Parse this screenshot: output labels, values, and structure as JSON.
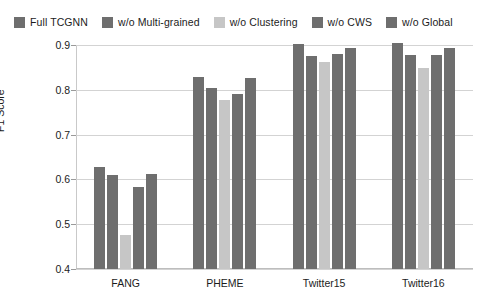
{
  "chart_data": {
    "type": "bar",
    "title": "",
    "subtitle": "",
    "xlabel": "",
    "ylabel": "F1 Score",
    "ylim": [
      0.4,
      0.9
    ],
    "ytick_labels": [
      "0.9",
      "0.8",
      "0.7",
      "0.6",
      "0.5",
      "0.4"
    ],
    "ytick_values": [
      0.9,
      0.8,
      0.7,
      0.6,
      0.5,
      0.4
    ],
    "grid": true,
    "grid_axis": "y",
    "legend_position": "top",
    "categories": [
      "FANG",
      "PHEME",
      "Twitter15",
      "Twitter16"
    ],
    "series": [
      {
        "name": "Full TCGNN",
        "color": "#6e6e6e",
        "values": [
          0.627,
          0.828,
          0.902,
          0.905
        ]
      },
      {
        "name": "w/o Multi-grained",
        "color": "#6e6e6e",
        "values": [
          0.61,
          0.803,
          0.875,
          0.877
        ]
      },
      {
        "name": "w/o Clustering",
        "color": "#c6c6c6",
        "values": [
          0.475,
          0.778,
          0.862,
          0.848
        ]
      },
      {
        "name": "w/o CWS",
        "color": "#6e6e6e",
        "values": [
          0.583,
          0.79,
          0.879,
          0.878
        ]
      },
      {
        "name": "w/o Global",
        "color": "#6e6e6e",
        "values": [
          0.613,
          0.827,
          0.894,
          0.894
        ]
      }
    ]
  },
  "colors": {
    "background": "#ffffff",
    "bar_dark": "#6e6e6e",
    "bar_light": "#c6c6c6",
    "gridline": "#d3d3d3",
    "axis": "#bdbdbd",
    "text": "#1c1c1c"
  }
}
